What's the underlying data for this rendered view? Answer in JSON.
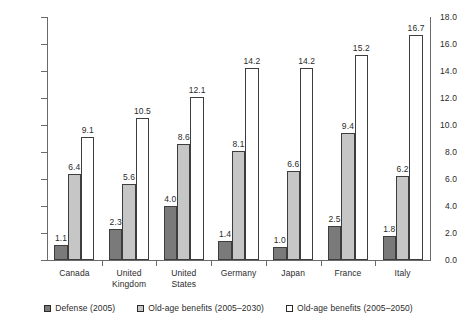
{
  "chart_data": {
    "type": "bar",
    "title": "",
    "subtitle": "",
    "xlabel": "",
    "ylabel": "",
    "ylim": [
      0.0,
      18.0
    ],
    "ytick_step": 2.0,
    "ytick_labels": [
      "0.0",
      "2.0",
      "4.0",
      "6.0",
      "8.0",
      "10.0",
      "12.0",
      "14.0",
      "16.0",
      "18.0"
    ],
    "grid": false,
    "legend_position": "bottom",
    "categories": [
      "Canada",
      "United\nKingdom",
      "United\nStates",
      "Germany",
      "Japan",
      "France",
      "Italy"
    ],
    "series": [
      {
        "name": "Defense (2005)",
        "color": "#7a7a7a",
        "values": [
          1.1,
          2.3,
          4.0,
          1.4,
          1.0,
          2.5,
          1.8
        ],
        "labels": [
          "1.1",
          "2.3",
          "4.0",
          "1.4",
          "1.0",
          "2.5",
          "1.8"
        ]
      },
      {
        "name": "Old-age benefits (2005–2030)",
        "color": "#c6c6c6",
        "values": [
          6.4,
          5.6,
          8.6,
          8.1,
          6.6,
          9.4,
          6.2
        ],
        "labels": [
          "6.4",
          "5.6",
          "8.6",
          "8.1",
          "6.6",
          "9.4",
          "6.2"
        ]
      },
      {
        "name": "Old-age benefits (2005–2050)",
        "color": "#ffffff",
        "values": [
          9.1,
          10.5,
          12.1,
          14.2,
          14.2,
          15.2,
          16.7
        ],
        "labels": [
          "9.1",
          "10.5",
          "12.1",
          "14.2",
          "14.2",
          "15.2",
          "16.7"
        ]
      }
    ]
  },
  "legend": {
    "items": [
      {
        "label": "Defense (2005)",
        "swatch": "dark-gray-square-icon"
      },
      {
        "label": "Old-age benefits (2005–2030)",
        "swatch": "light-gray-square-icon"
      },
      {
        "label": "Old-age benefits (2005–2050)",
        "swatch": "white-square-icon"
      }
    ]
  },
  "axis": {
    "y_ticks": [
      "0.0",
      "2.0",
      "4.0",
      "6.0",
      "8.0",
      "10.0",
      "12.0",
      "14.0",
      "16.0",
      "18.0"
    ]
  }
}
